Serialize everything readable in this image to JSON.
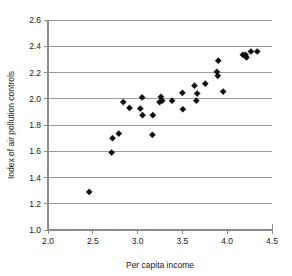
{
  "chart_data": {
    "type": "scatter",
    "title": "",
    "xlabel": "Per capita income",
    "ylabel": "Index of air pollution controls",
    "xlim": [
      2.0,
      4.5
    ],
    "ylim": [
      1.0,
      2.6
    ],
    "xticks": [
      "2.0",
      "2.5",
      "3.0",
      "3.5",
      "4.0",
      "4.5"
    ],
    "xtick_values": [
      2.0,
      2.5,
      3.0,
      3.5,
      4.0,
      4.5
    ],
    "yticks": [
      "1.0",
      "1.2",
      "1.4",
      "1.6",
      "1.8",
      "2.0",
      "2.2",
      "2.4",
      "2.6"
    ],
    "ytick_values": [
      1.0,
      1.2,
      1.4,
      1.6,
      1.8,
      2.0,
      2.2,
      2.4,
      2.6
    ],
    "grid": "horizontal",
    "legend": "none",
    "marker_style": "filled-diamond",
    "marker_color": "#0d0d0d",
    "gridline_color": "#9a9a9a",
    "points": [
      {
        "x": 2.46,
        "y": 1.29
      },
      {
        "x": 2.71,
        "y": 1.59
      },
      {
        "x": 2.72,
        "y": 1.7
      },
      {
        "x": 2.79,
        "y": 1.735
      },
      {
        "x": 2.84,
        "y": 1.975
      },
      {
        "x": 2.91,
        "y": 1.93
      },
      {
        "x": 3.03,
        "y": 1.925
      },
      {
        "x": 3.05,
        "y": 2.01
      },
      {
        "x": 3.055,
        "y": 1.875
      },
      {
        "x": 3.17,
        "y": 1.875
      },
      {
        "x": 3.165,
        "y": 1.725
      },
      {
        "x": 3.245,
        "y": 1.975
      },
      {
        "x": 3.26,
        "y": 2.015
      },
      {
        "x": 3.275,
        "y": 1.985
      },
      {
        "x": 3.385,
        "y": 1.985
      },
      {
        "x": 3.5,
        "y": 2.045
      },
      {
        "x": 3.505,
        "y": 1.92
      },
      {
        "x": 3.635,
        "y": 2.1
      },
      {
        "x": 3.655,
        "y": 1.985
      },
      {
        "x": 3.665,
        "y": 2.04
      },
      {
        "x": 3.755,
        "y": 2.115
      },
      {
        "x": 3.885,
        "y": 2.205
      },
      {
        "x": 3.895,
        "y": 2.175
      },
      {
        "x": 3.9,
        "y": 2.29
      },
      {
        "x": 3.955,
        "y": 2.055
      },
      {
        "x": 4.175,
        "y": 2.335
      },
      {
        "x": 4.205,
        "y": 2.335
      },
      {
        "x": 4.215,
        "y": 2.315
      },
      {
        "x": 4.265,
        "y": 2.36
      },
      {
        "x": 4.335,
        "y": 2.36
      }
    ]
  }
}
